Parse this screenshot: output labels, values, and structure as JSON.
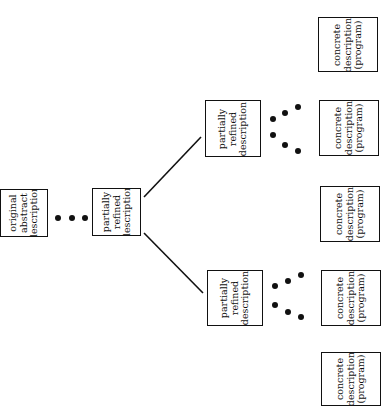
{
  "diagram": {
    "title": "",
    "orientation": "rotated-90-ccw",
    "nodes": [
      {
        "id": "original",
        "lines": [
          "original",
          "abstract",
          "description"
        ],
        "x": 0,
        "y": 189,
        "w": 48,
        "h": 48
      },
      {
        "id": "partial-center",
        "lines": [
          "partially",
          "refined",
          "description"
        ],
        "x": 92,
        "y": 188,
        "w": 49,
        "h": 48
      },
      {
        "id": "partial-upper",
        "lines": [
          "partially",
          "refined",
          "description"
        ],
        "x": 205,
        "y": 100,
        "w": 56,
        "h": 57
      },
      {
        "id": "partial-lower",
        "lines": [
          "partially",
          "refined",
          "description"
        ],
        "x": 207,
        "y": 270,
        "w": 56,
        "h": 56
      },
      {
        "id": "concrete-1",
        "lines": [
          "concrete",
          "description",
          "(program)"
        ],
        "x": 318,
        "y": 17,
        "w": 60,
        "h": 55
      },
      {
        "id": "concrete-2",
        "lines": [
          "concrete",
          "description",
          "(program)"
        ],
        "x": 319,
        "y": 100,
        "w": 60,
        "h": 56
      },
      {
        "id": "concrete-3",
        "lines": [
          "concrete",
          "description",
          "(program)"
        ],
        "x": 320,
        "y": 186,
        "w": 60,
        "h": 56
      },
      {
        "id": "concrete-4",
        "lines": [
          "concrete",
          "description",
          "(program)"
        ],
        "x": 321,
        "y": 270,
        "w": 60,
        "h": 56
      },
      {
        "id": "concrete-5",
        "lines": [
          "concrete",
          "description",
          "(program)"
        ],
        "x": 321,
        "y": 352,
        "w": 60,
        "h": 54
      }
    ],
    "edges": [
      {
        "from": "partial-center",
        "to": "partial-upper",
        "x1": 144,
        "y1": 197,
        "x2": 201,
        "y2": 137
      },
      {
        "from": "partial-center",
        "to": "partial-lower",
        "x1": 144,
        "y1": 233,
        "x2": 203,
        "y2": 293
      }
    ],
    "ellipses": [
      {
        "between": "original-to-partial-center",
        "dots": [
          [
            58,
            218
          ],
          [
            72,
            218
          ],
          [
            85,
            218
          ]
        ]
      },
      {
        "between": "partial-upper-to-concrete-upper",
        "dots": [
          [
            273,
            119
          ],
          [
            285,
            113
          ],
          [
            298,
            107
          ]
        ]
      },
      {
        "between": "partial-upper-to-concrete-middle",
        "dots": [
          [
            273,
            135
          ],
          [
            285,
            145
          ],
          [
            298,
            151
          ]
        ]
      },
      {
        "between": "partial-lower-to-concrete-middle",
        "dots": [
          [
            275,
            286
          ],
          [
            288,
            281
          ],
          [
            301,
            275
          ]
        ]
      },
      {
        "between": "partial-lower-to-concrete-lower",
        "dots": [
          [
            275,
            305
          ],
          [
            288,
            312
          ],
          [
            301,
            317
          ]
        ]
      }
    ]
  }
}
